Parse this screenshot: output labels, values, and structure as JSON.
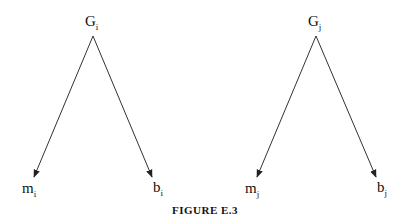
{
  "figure": {
    "caption": "FIGURE E.3",
    "trees": [
      {
        "root": {
          "base": "G",
          "sub": "i"
        },
        "children": [
          {
            "base": "m",
            "sub": "i"
          },
          {
            "base": "b",
            "sub": "i"
          }
        ]
      },
      {
        "root": {
          "base": "G",
          "sub": "j"
        },
        "children": [
          {
            "base": "m",
            "sub": "j"
          },
          {
            "base": "b",
            "sub": "j"
          }
        ]
      }
    ],
    "colors": {
      "line": "#222222",
      "background": "#ffffff"
    }
  }
}
